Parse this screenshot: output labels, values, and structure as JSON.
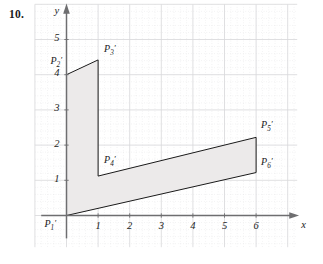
{
  "problem": {
    "number": "10."
  },
  "axes": {
    "x_name": "x",
    "y_name": "y",
    "x_ticks": [
      "1",
      "2",
      "3",
      "4",
      "5",
      "6"
    ],
    "y_ticks": [
      "1",
      "2",
      "3",
      "4",
      "5"
    ],
    "x_range": [
      -1,
      7.3
    ],
    "y_range": [
      -0.9,
      6.0
    ],
    "grid": true,
    "grid_minor_dotted": true
  },
  "point_labels": [
    {
      "name": "P1-prime",
      "base": "P",
      "sub": "1",
      "prime": "′",
      "x": 0.0,
      "y": 0.0,
      "label_dx": -22,
      "label_dy": 2
    },
    {
      "name": "P2-prime",
      "base": "P",
      "sub": "2",
      "prime": "′",
      "x": 0.0,
      "y": 4.0,
      "label_dx": -16,
      "label_dy": -20
    },
    {
      "name": "P3-prime",
      "base": "P",
      "sub": "3",
      "prime": "′",
      "x": 1.0,
      "y": 4.42,
      "label_dx": 6,
      "label_dy": -17
    },
    {
      "name": "P4-prime",
      "base": "P",
      "sub": "4",
      "prime": "′",
      "x": 1.0,
      "y": 1.12,
      "label_dx": 6,
      "label_dy": -22
    },
    {
      "name": "P5-prime",
      "base": "P",
      "sub": "5",
      "prime": "′",
      "x": 6.0,
      "y": 2.22,
      "label_dx": 5,
      "label_dy": -18
    },
    {
      "name": "P6-prime",
      "base": "P",
      "sub": "6",
      "prime": "′",
      "x": 6.0,
      "y": 1.22,
      "label_dx": 5,
      "label_dy": -17
    }
  ],
  "shape": {
    "name": "transformed-polygon",
    "fill": "#eceaea",
    "stroke": "#1a1a1a",
    "stroke_width": 1.0,
    "vertices": [
      {
        "x": 0.0,
        "y": 0.0
      },
      {
        "x": 0.0,
        "y": 4.0
      },
      {
        "x": 1.0,
        "y": 4.42
      },
      {
        "x": 1.0,
        "y": 1.12
      },
      {
        "x": 6.0,
        "y": 2.22
      },
      {
        "x": 6.0,
        "y": 1.22
      }
    ]
  },
  "colors": {
    "axis": "#6e6e70",
    "grid_major": "#d9d9dc",
    "grid_minor": "#dcdcdf",
    "shape_fill": "#eceaea",
    "shape_stroke": "#1a1a1a",
    "text": "#1a1a1a"
  }
}
